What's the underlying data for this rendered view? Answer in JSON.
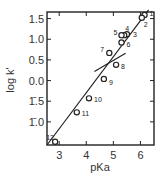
{
  "chart_data": {
    "type": "scatter",
    "title": "",
    "xlabel": "pKa",
    "ylabel": "log k'",
    "xlim": [
      2.55,
      6.5
    ],
    "ylim": [
      -1.56,
      1.66
    ],
    "x_ticks": [
      3,
      4,
      5,
      6
    ],
    "x_tick_labels": [
      "3",
      "4",
      "5",
      "6"
    ],
    "y_ticks": [
      1.5,
      1.0,
      0.5,
      0.0,
      -0.5,
      -1.0
    ],
    "y_tick_labels": [
      "1.5",
      "1.0",
      "0.5",
      "0.0",
      "1̄.5",
      "1̄.0"
    ],
    "grid": false,
    "legend": null,
    "points": [
      {
        "label": "1",
        "x": 6.15,
        "y": 1.59
      },
      {
        "label": "2",
        "x": 6.05,
        "y": 1.52
      },
      {
        "label": "3",
        "x": 5.5,
        "y": 1.12
      },
      {
        "label": "4",
        "x": 5.4,
        "y": 1.1
      },
      {
        "label": "5",
        "x": 5.3,
        "y": 1.1
      },
      {
        "label": "6",
        "x": 5.3,
        "y": 0.92
      },
      {
        "label": "7",
        "x": 4.85,
        "y": 0.67
      },
      {
        "label": "8",
        "x": 5.1,
        "y": 0.38
      },
      {
        "label": "9",
        "x": 4.65,
        "y": 0.04
      },
      {
        "label": "10",
        "x": 4.1,
        "y": -0.43
      },
      {
        "label": "11",
        "x": 3.65,
        "y": -0.77
      },
      {
        "label": "12",
        "x": 2.85,
        "y": -1.48
      }
    ],
    "fit_lines": [
      {
        "name": "main",
        "x": [
          2.55,
          6.3
        ],
        "y": [
          -1.56,
          1.71
        ]
      },
      {
        "name": "secondary",
        "x": [
          4.3,
          5.45
        ],
        "y": [
          0.22,
          0.66
        ]
      }
    ]
  }
}
